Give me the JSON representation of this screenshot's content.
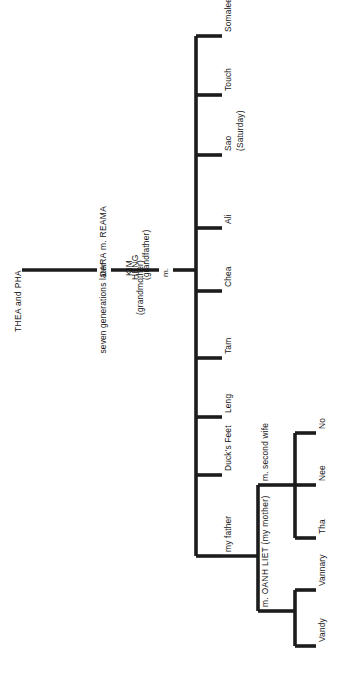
{
  "diagram": {
    "orientation": "rotated-90-counterclockwise",
    "line_color": "#1c1c1c",
    "background_color": "#ffffff"
  },
  "ancestors": {
    "root_couple": "THEA and PHA",
    "gap_note": "seven generations later",
    "second_couple": "DARA m. REAMA",
    "grandfather": "HENG",
    "grandfather_note": "(grandfather)",
    "grandmother": "KIM",
    "grandmother_note": "(grandmother)",
    "marriage_symbol_1": "m.",
    "marriage_symbol_2": "m."
  },
  "children": [
    {
      "name": "Somalee",
      "note": ""
    },
    {
      "name": "Touch",
      "note": ""
    },
    {
      "name": "Sao",
      "note": "(Saturday)"
    },
    {
      "name": "Ali",
      "note": ""
    },
    {
      "name": "Chea",
      "note": ""
    },
    {
      "name": "Tam",
      "note": ""
    },
    {
      "name": "Leng",
      "note": ""
    },
    {
      "name": "Duck's Feet",
      "note": ""
    },
    {
      "name": "my father",
      "note": ""
    }
  ],
  "father_marriages": [
    {
      "spouse": "m. second wife",
      "children": [
        {
          "name": "Tha"
        },
        {
          "name": "Nee"
        },
        {
          "name": "No"
        }
      ]
    },
    {
      "spouse": "m. OANH LIET (my mother)",
      "children": [
        {
          "name": "Vandy"
        },
        {
          "name": "Vannary"
        }
      ]
    }
  ]
}
